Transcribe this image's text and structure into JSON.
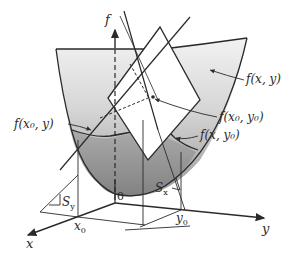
{
  "figure": {
    "colors": {
      "surface_light": "#eeeeee",
      "surface_dark": "#8f8f8f",
      "line": "#2a2a2a",
      "plane": "#ffffff",
      "background": "#ffffff"
    },
    "axes": {
      "f": "f",
      "x": "x",
      "y": "y",
      "origin": "0"
    },
    "ticks": {
      "x0_main": "x",
      "x0_sub": "0",
      "y0_main": "y",
      "y0_sub": "0"
    },
    "slopes": {
      "sy_main": "S",
      "sy_sub": "y",
      "sx_main": "S",
      "sx_sub": "x"
    },
    "labels": {
      "surface": "f(x, y)",
      "point": "f(x₀, y₀)",
      "curve_x0": "f(x₀, y)",
      "curve_y0": "f(x, y₀)"
    }
  }
}
